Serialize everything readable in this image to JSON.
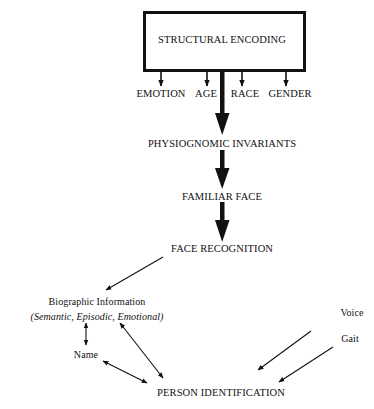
{
  "diagram": {
    "type": "flowchart",
    "top_box": {
      "label": "STRUCTURAL ENCODING"
    },
    "attributes": [
      {
        "label": "EMOTION"
      },
      {
        "label": "AGE"
      },
      {
        "label": "RACE"
      },
      {
        "label": "GENDER"
      }
    ],
    "stages": [
      {
        "label": "PHYSIOGNOMIC INVARIANTS"
      },
      {
        "label": "FAMILIAR FACE"
      },
      {
        "label": "FACE RECOGNITION"
      }
    ],
    "biographic": {
      "title": "Biographic Information",
      "subtitle": "(Semantic, Episodic, Emotional)"
    },
    "name": {
      "label": "Name"
    },
    "person_identification": {
      "label": "PERSON IDENTIFICATION"
    },
    "other_cues": [
      {
        "label": "Voice"
      },
      {
        "label": "Gait"
      }
    ],
    "edges": [
      {
        "from": "STRUCTURAL ENCODING",
        "to": "EMOTION",
        "style": "thin"
      },
      {
        "from": "STRUCTURAL ENCODING",
        "to": "AGE",
        "style": "thin"
      },
      {
        "from": "STRUCTURAL ENCODING",
        "to": "RACE",
        "style": "thin"
      },
      {
        "from": "STRUCTURAL ENCODING",
        "to": "GENDER",
        "style": "thin"
      },
      {
        "from": "STRUCTURAL ENCODING",
        "to": "PHYSIOGNOMIC INVARIANTS",
        "style": "thick"
      },
      {
        "from": "PHYSIOGNOMIC INVARIANTS",
        "to": "FAMILIAR FACE",
        "style": "thick"
      },
      {
        "from": "FAMILIAR FACE",
        "to": "FACE RECOGNITION",
        "style": "thick"
      },
      {
        "from": "FACE RECOGNITION",
        "to": "Biographic Information",
        "style": "thin"
      },
      {
        "from": "Biographic Information",
        "to": "Name",
        "style": "bidirectional"
      },
      {
        "from": "Biographic Information",
        "to": "PERSON IDENTIFICATION",
        "style": "bidirectional"
      },
      {
        "from": "Name",
        "to": "PERSON IDENTIFICATION",
        "style": "bidirectional"
      },
      {
        "from": "Voice",
        "to": "PERSON IDENTIFICATION",
        "style": "thin"
      },
      {
        "from": "Gait",
        "to": "PERSON IDENTIFICATION",
        "style": "thin"
      }
    ]
  }
}
